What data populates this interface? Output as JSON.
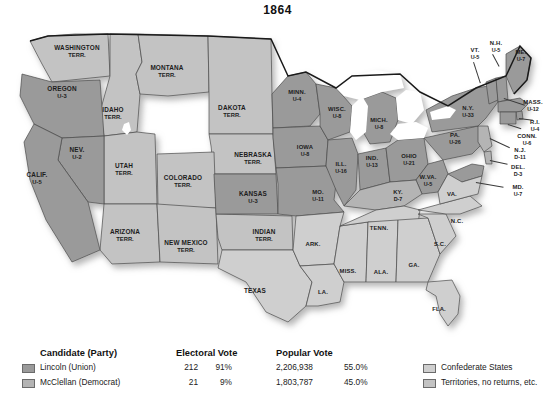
{
  "title": "1864",
  "colors": {
    "union": "#9a9a9a",
    "democrat": "#b4b4b4",
    "confederate": "#cfcfcf",
    "territory": "#c3c3c3",
    "lake": "#ffffff",
    "border": "#4a4a4a",
    "outline": "#1a1a1a",
    "text": "#1c1c1c",
    "background": "#ffffff"
  },
  "map": {
    "regions": [
      {
        "name": "washington-territory",
        "label": "WASHINGTON",
        "label2": "TERR.",
        "value": "",
        "x": 77,
        "y": 38,
        "fill": "territory"
      },
      {
        "name": "oregon",
        "label": "OREGON",
        "label2": "",
        "value": "U-3",
        "x": 62,
        "y": 79,
        "fill": "union"
      },
      {
        "name": "idaho-territory",
        "label": "IDAHO",
        "label2": "TERR.",
        "value": "",
        "x": 113,
        "y": 100,
        "fill": "territory"
      },
      {
        "name": "montana-territory",
        "label": "MONTANA",
        "label2": "TERR.",
        "value": "",
        "x": 167,
        "y": 58,
        "fill": "territory"
      },
      {
        "name": "dakota-territory",
        "label": "DAKOTA",
        "label2": "TERR.",
        "value": "",
        "x": 232,
        "y": 98,
        "fill": "territory"
      },
      {
        "name": "nevada",
        "label": "NEV.",
        "label2": "",
        "value": "U-2",
        "x": 77,
        "y": 140,
        "fill": "union"
      },
      {
        "name": "california",
        "label": "CALIF.",
        "label2": "",
        "value": "U-5",
        "x": 37,
        "y": 165,
        "fill": "union"
      },
      {
        "name": "utah-territory",
        "label": "UTAH",
        "label2": "TERR.",
        "value": "",
        "x": 124,
        "y": 156,
        "fill": "territory"
      },
      {
        "name": "colorado-territory",
        "label": "COLORADO",
        "label2": "TERR.",
        "value": "",
        "x": 183,
        "y": 168,
        "fill": "territory"
      },
      {
        "name": "nebraska-territory",
        "label": "NEBRASKA",
        "label2": "TERR.",
        "value": "",
        "x": 253,
        "y": 145,
        "fill": "territory"
      },
      {
        "name": "arizona-territory",
        "label": "ARIZONA",
        "label2": "TERR.",
        "value": "",
        "x": 125,
        "y": 222,
        "fill": "territory"
      },
      {
        "name": "new-mexico-territory",
        "label": "NEW MEXICO",
        "label2": "TERR.",
        "value": "",
        "x": 186,
        "y": 233,
        "fill": "territory"
      },
      {
        "name": "kansas",
        "label": "KANSAS",
        "label2": "",
        "value": "U-3",
        "x": 253,
        "y": 184,
        "fill": "union"
      },
      {
        "name": "indian-territory",
        "label": "INDIAN",
        "label2": "TERR.",
        "value": "",
        "x": 264,
        "y": 222,
        "fill": "territory"
      },
      {
        "name": "texas",
        "label": "TEXAS",
        "label2": "",
        "value": "",
        "x": 255,
        "y": 277,
        "fill": "confederate"
      },
      {
        "name": "minnesota",
        "label": "MINN.",
        "label2": "",
        "value": "U-4",
        "x": 297,
        "y": 82,
        "fill": "union"
      },
      {
        "name": "iowa",
        "label": "IOWA",
        "label2": "",
        "value": "U-8",
        "x": 305,
        "y": 137,
        "fill": "union"
      },
      {
        "name": "missouri",
        "label": "MO.",
        "label2": "",
        "value": "U-11",
        "x": 318,
        "y": 182,
        "fill": "union"
      },
      {
        "name": "arkansas",
        "label": "ARK.",
        "label2": "",
        "value": "",
        "x": 313,
        "y": 230,
        "fill": "confederate"
      },
      {
        "name": "louisiana",
        "label": "LA.",
        "label2": "",
        "value": "",
        "x": 323,
        "y": 278,
        "fill": "confederate"
      },
      {
        "name": "wisconsin",
        "label": "WISC.",
        "label2": "",
        "value": "U-8",
        "x": 337,
        "y": 99,
        "fill": "union"
      },
      {
        "name": "illinois",
        "label": "ILL.",
        "label2": "",
        "value": "U-16",
        "x": 341,
        "y": 154,
        "fill": "union"
      },
      {
        "name": "mississippi",
        "label": "MISS.",
        "label2": "",
        "value": "",
        "x": 348,
        "y": 257,
        "fill": "confederate"
      },
      {
        "name": "michigan",
        "label": "MICH.",
        "label2": "",
        "value": "U-8",
        "x": 379,
        "y": 110,
        "fill": "union"
      },
      {
        "name": "indiana",
        "label": "IND.",
        "label2": "",
        "value": "U-13",
        "x": 372,
        "y": 148,
        "fill": "union"
      },
      {
        "name": "kentucky",
        "label": "KY.",
        "label2": "",
        "value": "D-7",
        "x": 398,
        "y": 182,
        "fill": "democrat"
      },
      {
        "name": "tennessee",
        "label": "TENN.",
        "label2": "",
        "value": "",
        "x": 379,
        "y": 214,
        "fill": "confederate"
      },
      {
        "name": "alabama",
        "label": "ALA.",
        "label2": "",
        "value": "",
        "x": 381,
        "y": 258,
        "fill": "confederate"
      },
      {
        "name": "ohio",
        "label": "OHIO",
        "label2": "",
        "value": "U-21",
        "x": 409,
        "y": 146,
        "fill": "union"
      },
      {
        "name": "west-virginia",
        "label": "W.VA.",
        "label2": "",
        "value": "U-5",
        "x": 428,
        "y": 167,
        "fill": "union"
      },
      {
        "name": "virginia",
        "label": "VA.",
        "label2": "",
        "value": "",
        "x": 452,
        "y": 180,
        "fill": "confederate"
      },
      {
        "name": "georgia",
        "label": "GA.",
        "label2": "",
        "value": "",
        "x": 414,
        "y": 251,
        "fill": "confederate"
      },
      {
        "name": "south-carolina",
        "label": "S.C.",
        "label2": "",
        "value": "",
        "x": 440,
        "y": 230,
        "fill": "confederate"
      },
      {
        "name": "north-carolina",
        "label": "N.C.",
        "label2": "",
        "value": "",
        "x": 457,
        "y": 207,
        "fill": "confederate"
      },
      {
        "name": "florida",
        "label": "FLA.",
        "label2": "",
        "value": "",
        "x": 439,
        "y": 295,
        "fill": "confederate"
      },
      {
        "name": "pennsylvania",
        "label": "PA.",
        "label2": "",
        "value": "U-26",
        "x": 455,
        "y": 125,
        "fill": "union"
      },
      {
        "name": "new-york",
        "label": "N.Y.",
        "label2": "",
        "value": "U-33",
        "x": 468,
        "y": 98,
        "fill": "union"
      }
    ],
    "callouts": [
      {
        "name": "new-hampshire",
        "label": "N.H.",
        "value": "U-5",
        "x": 496,
        "y": 33
      },
      {
        "name": "vermont",
        "label": "VT.",
        "value": "U-5",
        "x": 475,
        "y": 40
      },
      {
        "name": "maine",
        "label": "ME.",
        "value": "U-7",
        "x": 521,
        "y": 42
      },
      {
        "name": "massachusetts",
        "label": "MASS.",
        "value": "U-12",
        "x": 533,
        "y": 92
      },
      {
        "name": "rhode-island",
        "label": "R.I.",
        "value": "U-4",
        "x": 535,
        "y": 112
      },
      {
        "name": "connecticut",
        "label": "CONN.",
        "value": "U-6",
        "x": 527,
        "y": 126
      },
      {
        "name": "new-jersey",
        "label": "N.J.",
        "value": "D-11",
        "x": 520,
        "y": 140
      },
      {
        "name": "delaware",
        "label": "DEL.",
        "value": "D-3",
        "x": 518,
        "y": 157
      },
      {
        "name": "maryland",
        "label": "MD.",
        "value": "U-7",
        "x": 518,
        "y": 177
      }
    ]
  },
  "legend": {
    "headers": {
      "candidate": "Candidate (Party)",
      "electoral": "Electoral Vote",
      "popular": "Popular Vote"
    },
    "rows": [
      {
        "name": "lincoln",
        "swatch": "sw-lincoln",
        "candidate": "Lincoln (Union)",
        "electoral_votes": "212",
        "electoral_pct": "91%",
        "popular_votes": "2,206,938",
        "popular_pct": "55.0%"
      },
      {
        "name": "mcclellan",
        "swatch": "sw-mcclellan",
        "candidate": "McClellan (Democrat)",
        "electoral_votes": "21",
        "electoral_pct": "9%",
        "popular_votes": "1,803,787",
        "popular_pct": "45.0%"
      }
    ],
    "other": [
      {
        "name": "confederate-states",
        "swatch": "sw-conf",
        "label": "Confederate States"
      },
      {
        "name": "territories",
        "swatch": "sw-terr",
        "label": "Territories, no returns, etc."
      }
    ]
  }
}
